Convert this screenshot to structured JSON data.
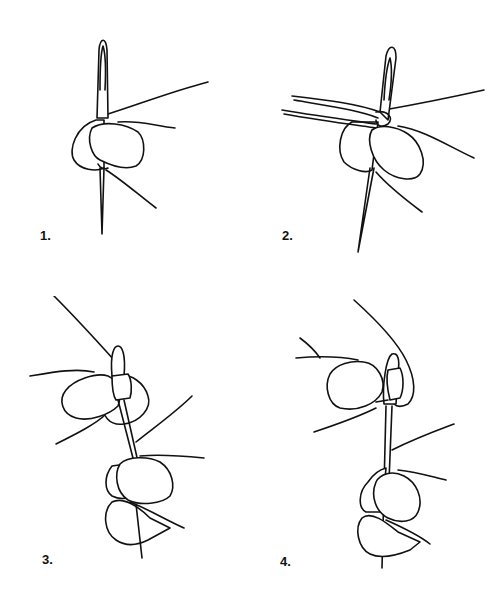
{
  "figure": {
    "colors": {
      "line": "#111111",
      "background": "#ffffff"
    },
    "steps": [
      {
        "label": "1.",
        "depiction": "needle pushed through fingertips"
      },
      {
        "label": "2.",
        "depiction": "thread looped around needle eye"
      },
      {
        "label": "3.",
        "depiction": "bead slid over needle eye"
      },
      {
        "label": "4.",
        "depiction": "bead pulled down onto thread"
      }
    ]
  }
}
